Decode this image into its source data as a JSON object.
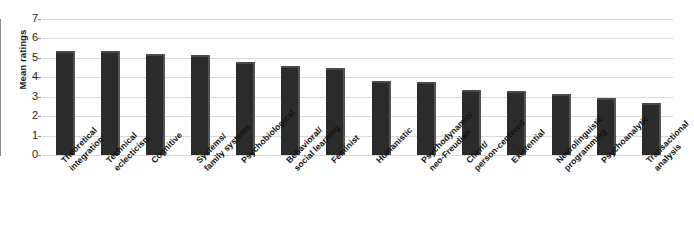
{
  "chart_data": {
    "type": "bar",
    "title": "",
    "xlabel": "",
    "ylabel": "Mean ratings",
    "ylim": [
      0,
      7
    ],
    "yticks": [
      0,
      1,
      2,
      3,
      4,
      5,
      6,
      7
    ],
    "grid": true,
    "legend": "none",
    "bar_color": "#2b2b2b",
    "gridline_color": "#d9d9d9",
    "axis_color": "#8a8a8a",
    "categories": [
      "Theoretical\nintegration",
      "Technical\neclecticism",
      "Cognitive",
      "Systems/\nfamily systems",
      "Psychobiological",
      "Behavioral/\nsocial learning",
      "Feminist",
      "Humanistic",
      "Psychodynamic/\nneo-Freudian",
      "Client/\nperson-centered",
      "Existential",
      "Neurolinguistic\nprogramming",
      "Psychoanalytic",
      "Transactional\nanalysis"
    ],
    "values": [
      5.25,
      5.25,
      5.1,
      5.05,
      4.7,
      4.5,
      4.4,
      3.7,
      3.65,
      3.25,
      3.2,
      3.05,
      2.85,
      2.55
    ]
  }
}
